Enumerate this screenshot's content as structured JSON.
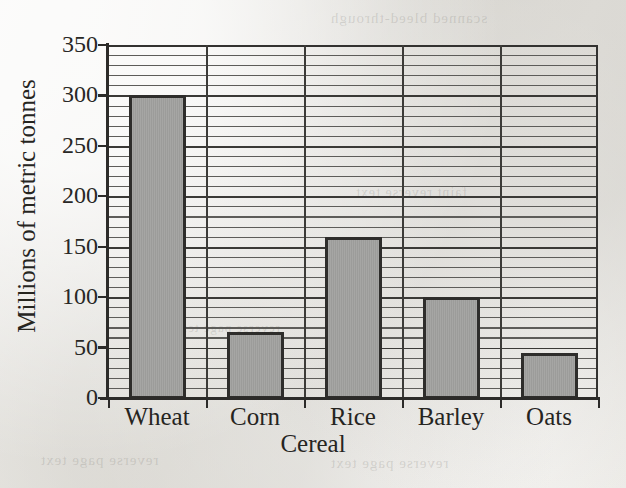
{
  "chart_data": {
    "type": "bar",
    "title": "",
    "xlabel": "Cereal",
    "ylabel": "Millions of metric tonnes",
    "categories": [
      "Wheat",
      "Corn",
      "Rice",
      "Barley",
      "Oats"
    ],
    "values": [
      300,
      65,
      160,
      100,
      45
    ],
    "ylim": [
      0,
      350
    ],
    "ytick_labels": [
      "0",
      "50",
      "100",
      "150",
      "200",
      "250",
      "300",
      "350"
    ],
    "ytick_values": [
      0,
      50,
      100,
      150,
      200,
      250,
      300,
      350
    ],
    "grid": "horizontal major every 50, minor every 10; vertical category separators",
    "legend": "none",
    "bar_fill_color": "#9c9c9a",
    "bar_edge_color": "#2e2d2b",
    "axis_color": "#2c2b29",
    "background_color": "#eceae6"
  },
  "page": {
    "ghost_text_top": "scanned bleed-through",
    "ghost_text_mid": "faint reverse text",
    "ghost_text_low": "reverse page text",
    "ghost_text_low2": "reverse page text",
    "ghost_text_left": "reverse page text"
  }
}
